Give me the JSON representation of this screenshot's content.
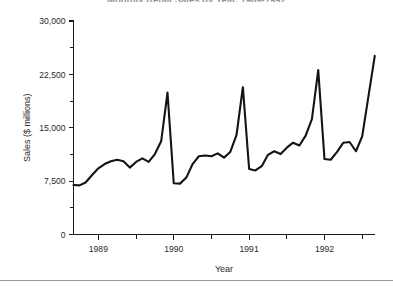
{
  "chart_data": {
    "type": "line",
    "title": "Monthly Retail Sales by Year, 1989-1992",
    "xlabel": "Year",
    "ylabel": "Sales ($ millions)",
    "xlim": [
      1988.67,
      1992.67
    ],
    "ylim": [
      0,
      30000
    ],
    "grid": false,
    "legend": null,
    "y_ticks": [
      0,
      7500,
      15000,
      22500,
      30000
    ],
    "y_tick_labels": [
      "0",
      "7,500",
      "15,000",
      "22,500",
      "30,000"
    ],
    "y_minor_ticks": [
      3750,
      11250,
      18750,
      26250
    ],
    "x_ticks": [
      1989,
      1990,
      1991,
      1992
    ],
    "x_tick_labels": [
      "1989",
      "1990",
      "1991",
      "1992"
    ],
    "x_minor_ticks": [
      1989.5,
      1990.5,
      1991.5,
      1992.5
    ],
    "line_color": "#141414",
    "series": [
      {
        "name": "Sales",
        "x": [
          1988.67,
          1988.75,
          1988.83,
          1988.92,
          1989.0,
          1989.083,
          1989.167,
          1989.25,
          1989.333,
          1989.417,
          1989.5,
          1989.583,
          1989.667,
          1989.75,
          1989.833,
          1989.917,
          1990.0,
          1990.083,
          1990.167,
          1990.25,
          1990.333,
          1990.417,
          1990.5,
          1990.583,
          1990.667,
          1990.75,
          1990.833,
          1990.917,
          1991.0,
          1991.083,
          1991.167,
          1991.25,
          1991.333,
          1991.417,
          1991.5,
          1991.583,
          1991.667,
          1991.75,
          1991.833,
          1991.917,
          1992.0,
          1992.083,
          1992.167,
          1992.25,
          1992.333,
          1992.417,
          1992.5,
          1992.583,
          1992.667
        ],
        "values": [
          6950,
          6900,
          7300,
          8400,
          9300,
          9900,
          10300,
          10500,
          10300,
          9400,
          10200,
          10700,
          10200,
          11300,
          13100,
          19950,
          7200,
          7150,
          8000,
          9900,
          11000,
          11100,
          11000,
          11400,
          10800,
          11600,
          14000,
          20700,
          9200,
          9000,
          9600,
          11200,
          11700,
          11300,
          12200,
          12900,
          12500,
          13900,
          16200,
          23100,
          10600,
          10500,
          11600,
          12900,
          13000,
          11700,
          13800,
          19400,
          25100
        ]
      }
    ]
  }
}
